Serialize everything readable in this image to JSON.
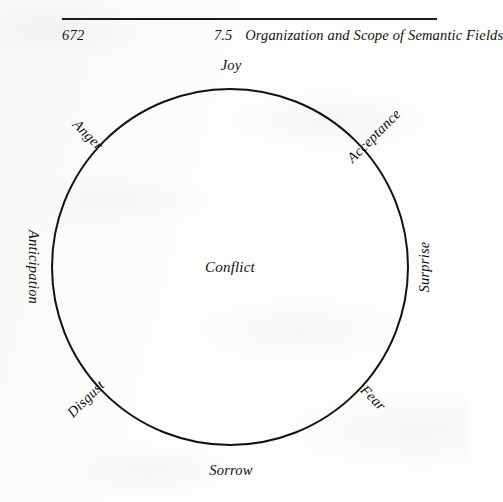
{
  "page": {
    "folio": "672",
    "section_number": "7.5",
    "running_title": "Organization and Scope of Semantic Fields"
  },
  "figure": {
    "name": "emotion-wheel",
    "center_label": "Conflict",
    "circle": {
      "center_x": 230,
      "center_y": 267,
      "radius": 178,
      "stroke_color": "#111111",
      "stroke_width": 2
    },
    "labels": [
      {
        "text": "Joy",
        "angle_deg": 90,
        "rotation": 0,
        "x": 231,
        "y": 65,
        "placement": "outside-top"
      },
      {
        "text": "Acceptance",
        "angle_deg": 45,
        "rotation": 45,
        "x": 374,
        "y": 136,
        "placement": "outside-upper-right"
      },
      {
        "text": "Surprise",
        "angle_deg": 0,
        "rotation": 90,
        "x": 424,
        "y": 267,
        "placement": "outside-right"
      },
      {
        "text": "Fear",
        "angle_deg": 315,
        "rotation": -45,
        "x": 373,
        "y": 398,
        "placement": "outside-lower-right"
      },
      {
        "text": "Sorrow",
        "angle_deg": 270,
        "rotation": 0,
        "x": 231,
        "y": 470,
        "placement": "outside-bottom"
      },
      {
        "text": "Disgust",
        "angle_deg": 225,
        "rotation": 45,
        "x": 86,
        "y": 399,
        "placement": "outside-lower-left"
      },
      {
        "text": "Anticipation",
        "angle_deg": 180,
        "rotation": -90,
        "x": 33,
        "y": 267,
        "placement": "outside-left"
      },
      {
        "text": "Anger",
        "angle_deg": 135,
        "rotation": -45,
        "x": 88,
        "y": 135,
        "placement": "outside-upper-left"
      }
    ]
  }
}
